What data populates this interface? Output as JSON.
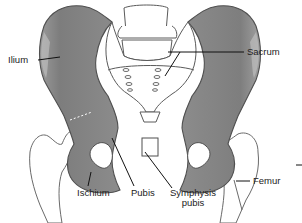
{
  "figure": {
    "colors": {
      "bone_fill": "#8a8a8a",
      "bone_dark": "#6f6f6f",
      "bone_light": "#b5b5b5",
      "outline": "#555555",
      "sacrum_fill": "#ffffff",
      "leader_line": "#111111",
      "text": "#222222"
    }
  },
  "labels": {
    "ilium": "Ilium",
    "sacrum": "Sacrum",
    "ischium": "Ischium",
    "pubis": "Pubis",
    "symphysis_line1": "Symphysis",
    "symphysis_line2": "pubis",
    "femur": "Femur"
  }
}
